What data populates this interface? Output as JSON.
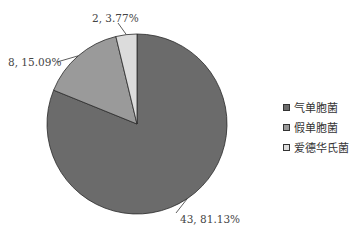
{
  "chart_data": {
    "type": "pie",
    "title": "",
    "categories": [
      "气单胞菌",
      "假单胞菌",
      "爱德华氏菌"
    ],
    "values": [
      43,
      8,
      2
    ],
    "percentages": [
      81.13,
      15.09,
      3.77
    ],
    "data_labels": [
      "43, 81.13%",
      "8, 15.09%",
      "2, 3.77%"
    ],
    "colors": [
      "#6b6b6b",
      "#9a9a9a",
      "#dcdcdc"
    ],
    "start_angle_deg": 0,
    "direction": "clockwise",
    "legend_position": "right"
  },
  "labels": {
    "slice0": "43, 81.13%",
    "slice1": "8, 15.09%",
    "slice2": "2, 3.77%"
  },
  "legend": {
    "items": [
      {
        "label": "气单胞菌",
        "color": "#6b6b6b"
      },
      {
        "label": "假单胞菌",
        "color": "#9a9a9a"
      },
      {
        "label": "爱德华氏菌",
        "color": "#dcdcdc"
      }
    ]
  }
}
